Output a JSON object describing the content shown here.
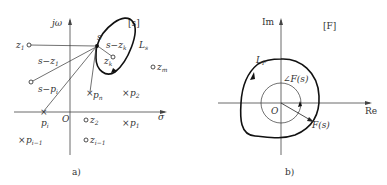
{
  "panel_a": {
    "caption": "a)",
    "plane_label": "[s]",
    "axis_y_label": "jω",
    "axis_x_label": "σ",
    "origin_label": "O",
    "point_s": "s",
    "contour_label": "L",
    "contour_sub": "s",
    "vector_labels": {
      "s_minus_z1": "s−z",
      "s_minus_z1_sub": "1",
      "s_minus_pi": "s−p",
      "s_minus_pi_sub": "i",
      "s_minus_zk": "s−z",
      "s_minus_zk_sub": "k"
    },
    "zeros": [
      {
        "name": "z",
        "sub": "1"
      },
      {
        "name": "z",
        "sub": "k"
      },
      {
        "name": "z",
        "sub": "m"
      },
      {
        "name": "z",
        "sub": "2"
      },
      {
        "name": "z",
        "sub": "i−1"
      }
    ],
    "poles": [
      {
        "name": "p",
        "sub": "n"
      },
      {
        "name": "p",
        "sub": "2"
      },
      {
        "name": "p",
        "sub": "i"
      },
      {
        "name": "p",
        "sub": "1"
      },
      {
        "name": "p",
        "sub": "i−1"
      }
    ]
  },
  "panel_b": {
    "caption": "b)",
    "plane_label": "[F]",
    "axis_y_label": "Im",
    "axis_x_label": "Re",
    "origin_label": "O",
    "contour_label": "L",
    "contour_sub": "F",
    "angle_label": "∠F(s)",
    "vector_label": "F(s)"
  }
}
